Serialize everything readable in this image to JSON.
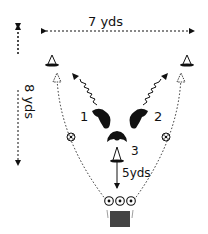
{
  "diagram": {
    "dimensions": {
      "width_label": "7 yds",
      "height_label": "8 yds",
      "distance_label": "5yds"
    },
    "players": [
      {
        "label": "1"
      },
      {
        "label": "2"
      },
      {
        "label": "3"
      }
    ],
    "elements": [
      "cone-left",
      "cone-right",
      "cone-center",
      "ball-left",
      "ball-right",
      "balls-row",
      "goal"
    ],
    "colors": {
      "ink": "#111111",
      "goal_fill": "#444444",
      "background": "#ffffff"
    }
  }
}
